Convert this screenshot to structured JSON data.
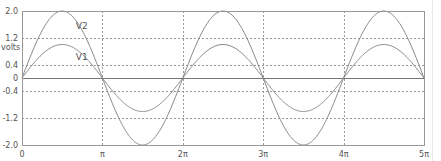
{
  "chart_data": {
    "type": "line",
    "title": "",
    "xlabel": "",
    "ylabel": "volts",
    "xlim": [
      0,
      15.70796
    ],
    "ylim": [
      -2.0,
      2.0
    ],
    "grid": true,
    "legend": "inline labels",
    "x_ticks": [
      {
        "value": 0,
        "label": "0"
      },
      {
        "value": 3.14159,
        "label": "π"
      },
      {
        "value": 6.28319,
        "label": "2π"
      },
      {
        "value": 9.42478,
        "label": "3π"
      },
      {
        "value": 12.56637,
        "label": "4π"
      },
      {
        "value": 15.70796,
        "label": "5π"
      }
    ],
    "y_ticks": [
      {
        "value": 2.0,
        "label": "2.0"
      },
      {
        "value": 1.2,
        "label": "1.2"
      },
      {
        "value": 0.4,
        "label": "0.4"
      },
      {
        "value": 0,
        "label": "0"
      },
      {
        "value": -0.4,
        "label": "-0.4"
      },
      {
        "value": -1.2,
        "label": "-1.2"
      },
      {
        "value": -2.0,
        "label": "-2.0"
      }
    ],
    "series": [
      {
        "name": "V1",
        "function": "1.0*sin(x)",
        "amplitude": 1.0,
        "color": "#888888",
        "label_pos": {
          "x": 2.1,
          "y": 0.55
        }
      },
      {
        "name": "V2",
        "function": "2.0*sin(x)",
        "amplitude": 2.0,
        "color": "#888888",
        "label_pos": {
          "x": 2.1,
          "y": 1.45
        }
      }
    ],
    "colors": {
      "axis": "#888888",
      "grid": "#999999",
      "zero_line": "#777777",
      "text": "#555555"
    }
  },
  "labels": {
    "ylabel": "volts"
  }
}
